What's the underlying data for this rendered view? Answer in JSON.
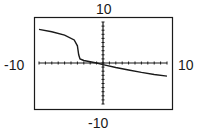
{
  "window_labels": {
    "ymax": "10",
    "ymin": "-10",
    "xmin": "-10",
    "xmax": "10"
  },
  "chart_data": {
    "type": "line",
    "title": "",
    "xlabel": "",
    "ylabel": "",
    "xlim": [
      -10,
      10
    ],
    "ylim": [
      -10,
      10
    ],
    "grid": false,
    "tick_marks": "every 1 unit on both axes",
    "legend": null,
    "series": [
      {
        "name": "f(x)",
        "x": [
          -10,
          -8,
          -6,
          -4.5,
          -4,
          -3.8,
          -3.6,
          -3,
          -2,
          -1,
          0,
          2,
          4,
          6,
          8,
          10
        ],
        "y": [
          8.2,
          7.6,
          6.8,
          5.6,
          4.2,
          2.0,
          1.0,
          0.6,
          0.3,
          0.0,
          -0.4,
          -1.1,
          -1.7,
          -2.3,
          -2.8,
          -3.2
        ]
      }
    ]
  },
  "colors": {
    "line": "#1a1a1a",
    "frame": "#1a1a1a",
    "background": "#ffffff"
  }
}
